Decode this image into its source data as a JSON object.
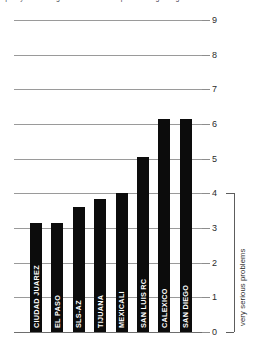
{
  "top_caption": {
    "text": "quality and strength of binational cooperation regarding"
  },
  "chart_data": {
    "type": "bar",
    "title": "",
    "subtitle": "",
    "xlabel": "",
    "ylabel": "very serious problems",
    "categories": [
      "CIUDAD JUAREZ",
      "EL PASO",
      "SLS-AZ",
      "TIJUANA",
      "MEXICALI",
      "SAN LUIS RC",
      "CALEXICO",
      "SAN DIEGO"
    ],
    "values": [
      3.15,
      3.15,
      3.6,
      3.85,
      4.0,
      5.05,
      6.15,
      6.15
    ],
    "ylim": [
      0,
      9
    ],
    "yticks": [
      0,
      1,
      2,
      3,
      4,
      5,
      6,
      7,
      8,
      9
    ],
    "ytick_labels": [
      "0",
      "1",
      "2",
      "3",
      "4",
      "5",
      "6",
      "7",
      "8",
      "9"
    ],
    "grid": true,
    "grid_axis": "y",
    "legend": false,
    "legend_position": "none",
    "bar_color": "#0c0c0c",
    "bar_label_color": "#ffffff",
    "gridline_color": "#9a9a9a",
    "background": "#ffffff",
    "annotations": [
      {
        "type": "bracket",
        "axis": "y",
        "from": 0,
        "to": 4,
        "label": "very serious problems",
        "side": "right"
      }
    ]
  }
}
